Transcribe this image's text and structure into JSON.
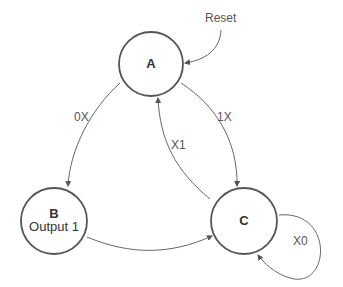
{
  "diagram": {
    "type": "state-machine",
    "states": [
      {
        "id": "A",
        "label": "A",
        "output": ""
      },
      {
        "id": "B",
        "label": "B",
        "output": "Output 1"
      },
      {
        "id": "C",
        "label": "C",
        "output": ""
      }
    ],
    "transitions": [
      {
        "from": "Reset",
        "to": "A",
        "label": "Reset"
      },
      {
        "from": "A",
        "to": "B",
        "label": "0X"
      },
      {
        "from": "A",
        "to": "C",
        "label": "1X"
      },
      {
        "from": "C",
        "to": "A",
        "label": "X1"
      },
      {
        "from": "B",
        "to": "C",
        "label": ""
      },
      {
        "from": "C",
        "to": "C",
        "label": "X0"
      }
    ],
    "colors": {
      "stroke": "#555555",
      "edge": "#666666",
      "text": "#333333"
    }
  }
}
